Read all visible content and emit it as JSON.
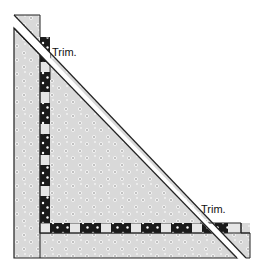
{
  "diagram": {
    "colors": {
      "background": "#ffffff",
      "fabric": "#d9d9d9",
      "fabric_dot": "#ffffff",
      "fabric_dot_center": "#555555",
      "dark_square": "#1a1a1a",
      "light_square": "#e6e6e6",
      "outline": "#222222"
    },
    "labels": [
      {
        "text": "Trim.",
        "x": 52,
        "y": 47
      },
      {
        "text": "Trim.",
        "x": 201,
        "y": 204
      }
    ],
    "vertical_strip": {
      "x": 40,
      "width": 10,
      "dark_segments": [
        [
          37,
          62
        ],
        [
          72,
          92
        ],
        [
          103,
          124
        ],
        [
          134,
          155
        ],
        [
          165,
          186
        ],
        [
          196,
          223
        ]
      ],
      "corner_light": [
        223,
        233
      ]
    },
    "horizontal_strip": {
      "y": 223,
      "height": 10,
      "dark_segments": [
        [
          50,
          70
        ],
        [
          80,
          101
        ],
        [
          111,
          131
        ],
        [
          141,
          161
        ],
        [
          171,
          192
        ],
        [
          202,
          228
        ]
      ],
      "end_x": 241
    }
  }
}
